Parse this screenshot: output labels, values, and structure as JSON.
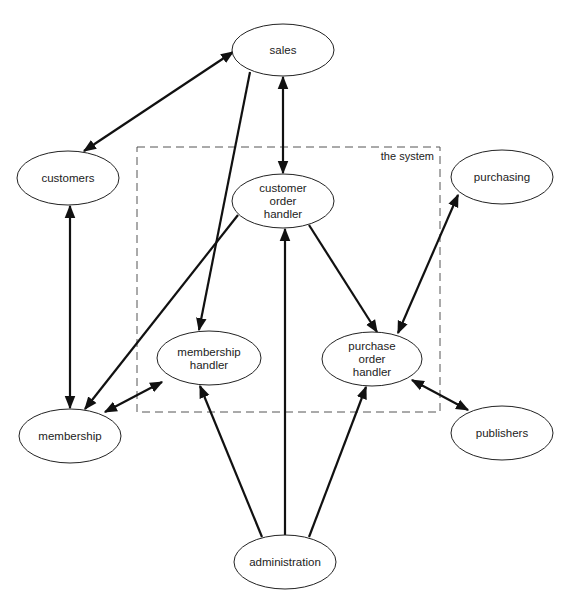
{
  "diagram": {
    "boundary": {
      "label": "the system",
      "x": 137,
      "y": 147,
      "w": 303,
      "h": 265
    },
    "nodes": [
      {
        "id": "sales",
        "lines": [
          "sales"
        ],
        "cx": 283,
        "cy": 50,
        "rx": 51,
        "ry": 26
      },
      {
        "id": "customers",
        "lines": [
          "customers"
        ],
        "cx": 68,
        "cy": 178,
        "rx": 51,
        "ry": 27
      },
      {
        "id": "customer-order-handler",
        "lines": [
          "customer",
          "order",
          "handler"
        ],
        "cx": 283,
        "cy": 201,
        "rx": 51,
        "ry": 27
      },
      {
        "id": "purchasing",
        "lines": [
          "purchasing"
        ],
        "cx": 502,
        "cy": 177,
        "rx": 51,
        "ry": 27
      },
      {
        "id": "membership-handler",
        "lines": [
          "membership",
          "handler"
        ],
        "cx": 209,
        "cy": 358,
        "rx": 52,
        "ry": 27
      },
      {
        "id": "purchase-order-handler",
        "lines": [
          "purchase",
          "order",
          "handler"
        ],
        "cx": 372,
        "cy": 359,
        "rx": 50,
        "ry": 27
      },
      {
        "id": "membership",
        "lines": [
          "membership"
        ],
        "cx": 70,
        "cy": 436,
        "rx": 51,
        "ry": 27
      },
      {
        "id": "publishers",
        "lines": [
          "publishers"
        ],
        "cx": 502,
        "cy": 433,
        "rx": 51,
        "ry": 27
      },
      {
        "id": "administration",
        "lines": [
          "administration"
        ],
        "cx": 285,
        "cy": 562,
        "rx": 51,
        "ry": 27
      }
    ],
    "edges": [
      {
        "from": "customers",
        "to": "sales",
        "x1": 84,
        "y1": 151,
        "x2": 233,
        "y2": 52,
        "start_arrow": true,
        "end_arrow": true
      },
      {
        "from": "sales",
        "to": "customer-order-handler",
        "x1": 283,
        "y1": 77,
        "x2": 283,
        "y2": 173,
        "start_arrow": true,
        "end_arrow": true
      },
      {
        "from": "sales",
        "to": "membership-handler",
        "x1": 250,
        "y1": 72,
        "x2": 199,
        "y2": 330,
        "start_arrow": false,
        "end_arrow": true
      },
      {
        "from": "customers",
        "to": "membership",
        "x1": 70,
        "y1": 206,
        "x2": 70,
        "y2": 408,
        "start_arrow": true,
        "end_arrow": true
      },
      {
        "from": "customer-order-handler",
        "to": "membership",
        "x1": 238,
        "y1": 215,
        "x2": 85,
        "y2": 409,
        "start_arrow": false,
        "end_arrow": true
      },
      {
        "from": "membership",
        "to": "membership-handler",
        "x1": 105,
        "y1": 412,
        "x2": 162,
        "y2": 382,
        "start_arrow": true,
        "end_arrow": true
      },
      {
        "from": "customer-order-handler",
        "to": "purchase-order-handler",
        "x1": 309,
        "y1": 225,
        "x2": 377,
        "y2": 332,
        "start_arrow": false,
        "end_arrow": true
      },
      {
        "from": "purchasing",
        "to": "purchase-order-handler",
        "x1": 458,
        "y1": 195,
        "x2": 398,
        "y2": 333,
        "start_arrow": true,
        "end_arrow": true
      },
      {
        "from": "purchase-order-handler",
        "to": "publishers",
        "x1": 412,
        "y1": 380,
        "x2": 468,
        "y2": 410,
        "start_arrow": true,
        "end_arrow": true
      },
      {
        "from": "administration",
        "to": "membership-handler",
        "x1": 262,
        "y1": 537,
        "x2": 200,
        "y2": 386,
        "start_arrow": false,
        "end_arrow": true
      },
      {
        "from": "administration",
        "to": "customer-order-handler",
        "x1": 285,
        "y1": 535,
        "x2": 285,
        "y2": 229,
        "start_arrow": false,
        "end_arrow": true
      },
      {
        "from": "administration",
        "to": "purchase-order-handler",
        "x1": 309,
        "y1": 537,
        "x2": 366,
        "y2": 387,
        "start_arrow": false,
        "end_arrow": true
      }
    ],
    "colors": {
      "line": "#111111",
      "background": "#ffffff",
      "text": "#222222"
    }
  }
}
